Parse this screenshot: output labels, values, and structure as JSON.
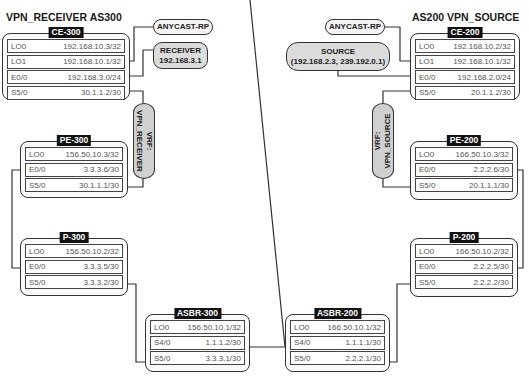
{
  "titles": {
    "left": "VPN_RECEIVER AS300",
    "right": "AS200 VPN_SOURCE"
  },
  "routers": {
    "ce300": {
      "name": "CE-300",
      "interfaces": [
        {
          "name": "LO0",
          "ip": "192.168.10.3/32"
        },
        {
          "name": "LO1",
          "ip": "192.168.10.1/32"
        },
        {
          "name": "E0/0",
          "ip": "192.168.3.0/24"
        },
        {
          "name": "S5/0",
          "ip": "30.1.1.2/30"
        }
      ]
    },
    "pe300": {
      "name": "PE-300",
      "interfaces": [
        {
          "name": "LO0",
          "ip": "156.50.10.3/32"
        },
        {
          "name": "E0/0",
          "ip": "3.3.3.6/30"
        },
        {
          "name": "S5/0",
          "ip": "30.1.1.1/30"
        }
      ]
    },
    "p300": {
      "name": "P-300",
      "interfaces": [
        {
          "name": "LO0",
          "ip": "156.50.10.2/32"
        },
        {
          "name": "E0/0",
          "ip": "3.3.3.5/30"
        },
        {
          "name": "S5/0",
          "ip": "3.3.3.2/30"
        }
      ]
    },
    "asbr300": {
      "name": "ASBR-300",
      "interfaces": [
        {
          "name": "LO0",
          "ip": "156.50.10.1/32"
        },
        {
          "name": "S4/0",
          "ip": "1.1.1.2/30"
        },
        {
          "name": "S5/0",
          "ip": "3.3.3.1/30"
        }
      ]
    },
    "asbr200": {
      "name": "ASBR-200",
      "interfaces": [
        {
          "name": "LO0",
          "ip": "166.50.10.1/32"
        },
        {
          "name": "S4/0",
          "ip": "1.1.1.1/30"
        },
        {
          "name": "S5/0",
          "ip": "2.2.2.1/30"
        }
      ]
    },
    "p200": {
      "name": "P-200",
      "interfaces": [
        {
          "name": "LO0",
          "ip": "166.50.10.2/32"
        },
        {
          "name": "E0/0",
          "ip": "2.2.2.5/30"
        },
        {
          "name": "S5/0",
          "ip": "2.2.2.2/30"
        }
      ]
    },
    "pe200": {
      "name": "PE-200",
      "interfaces": [
        {
          "name": "LO0",
          "ip": "166.50.10.3/32"
        },
        {
          "name": "E0/0",
          "ip": "2.2.2.6/30"
        },
        {
          "name": "S5/0",
          "ip": "20.1.1.1/30"
        }
      ]
    },
    "ce200": {
      "name": "CE-200",
      "interfaces": [
        {
          "name": "LO0",
          "ip": "192.168.10.2/32"
        },
        {
          "name": "LO1",
          "ip": "192.168.10.1/32"
        },
        {
          "name": "E0/0",
          "ip": "192.168.2.0/24"
        },
        {
          "name": "S5/0",
          "ip": "20.1.1.2/30"
        }
      ]
    }
  },
  "annotations": {
    "anycast_left": "ANYCAST-RP",
    "receiver_line1": "RECEIVER",
    "receiver_line2": "192.168.3.1",
    "anycast_right": "ANYCAST-RP",
    "source_line1": "SOURCE",
    "source_line2": "(192.168.2.3, 239.192.0.1)",
    "vrf_receiver_line1": "VRF:",
    "vrf_receiver_line2": "VPN_RECEIVER",
    "vrf_source_line1": "VRF:",
    "vrf_source_line2": "VPN_SOURCE"
  },
  "colors": {
    "line": "#333333",
    "label_bg": "#111111",
    "pill_fill": "#dcdcdc"
  }
}
